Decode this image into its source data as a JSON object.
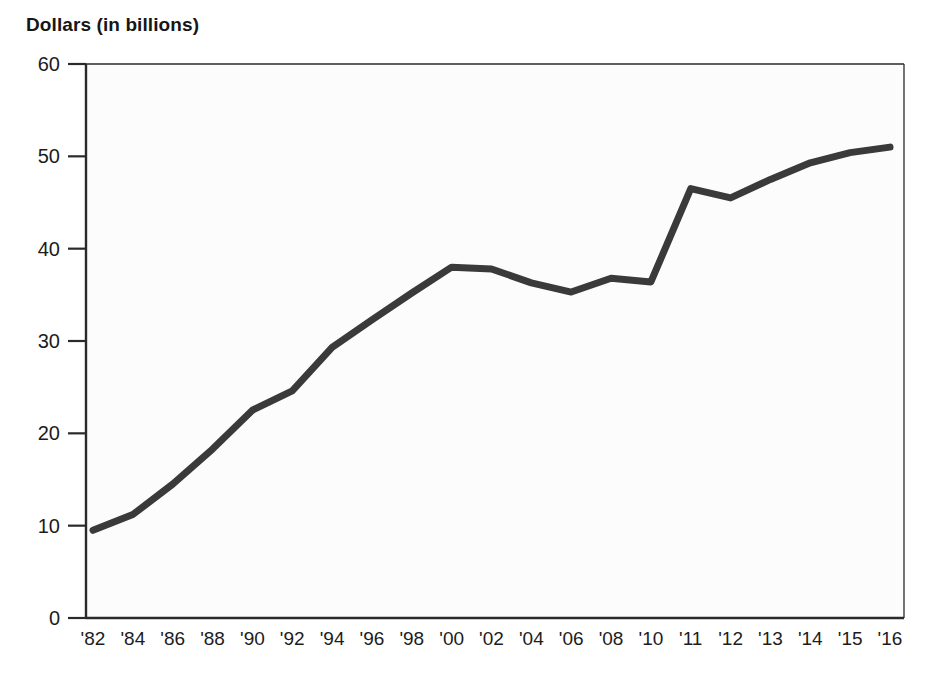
{
  "chart_data": {
    "type": "line",
    "title": "Dollars (in billions)",
    "xlabel": "",
    "ylabel": "Dollars (in billions)",
    "categories": [
      "'82",
      "'84",
      "'86",
      "'88",
      "'90",
      "'92",
      "'94",
      "'96",
      "'98",
      "'00",
      "'02",
      "'04",
      "'06",
      "'08",
      "'10",
      "'11",
      "'12",
      "'13",
      "'14",
      "'15",
      "'16"
    ],
    "values": [
      9.5,
      11.2,
      14.5,
      18.3,
      22.5,
      24.6,
      29.3,
      32.3,
      35.2,
      38.0,
      37.8,
      36.3,
      35.3,
      36.8,
      36.4,
      46.5,
      45.5,
      47.5,
      49.3,
      50.4,
      51.0
    ],
    "ylim": [
      0,
      60
    ],
    "yticks": [
      0,
      10,
      20,
      30,
      40,
      50,
      60
    ],
    "ytick_labels": [
      "0",
      "10",
      "20",
      "30",
      "40",
      "50",
      "60"
    ],
    "grid": false,
    "legend": null,
    "line_color": "#3a3a3a",
    "line_width": 7,
    "axis_color": "#2a2a2a",
    "background": "#ffffff"
  },
  "axes": {
    "y_axis_name": "dollars-axis",
    "x_axis_name": "year-axis"
  }
}
